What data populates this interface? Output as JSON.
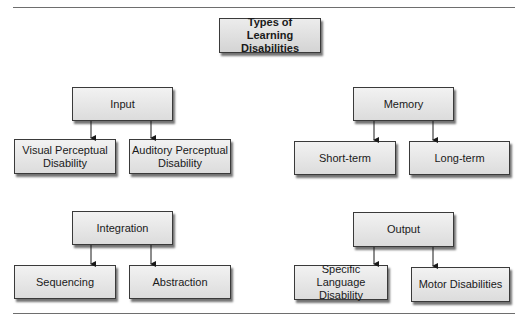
{
  "diagram": {
    "title": "Types of Learning Disabilities",
    "groups": [
      {
        "id": "input",
        "label": "Input",
        "children": [
          "Visual Perceptual Disability",
          "Auditory Perceptual Disability"
        ]
      },
      {
        "id": "memory",
        "label": "Memory",
        "children": [
          "Short-term",
          "Long-term"
        ]
      },
      {
        "id": "integration",
        "label": "Integration",
        "children": [
          "Sequencing",
          "Abstraction"
        ]
      },
      {
        "id": "output",
        "label": "Output",
        "children": [
          "Specific Language Disability",
          "Motor Disabilities"
        ]
      }
    ]
  },
  "colors": {
    "box_border": "#3a3a3a",
    "box_fill_top": "#f2f2f2",
    "box_fill_bottom": "#dcdcdc",
    "rule": "#6e6e6e",
    "arrow": "#1a1a1a"
  }
}
